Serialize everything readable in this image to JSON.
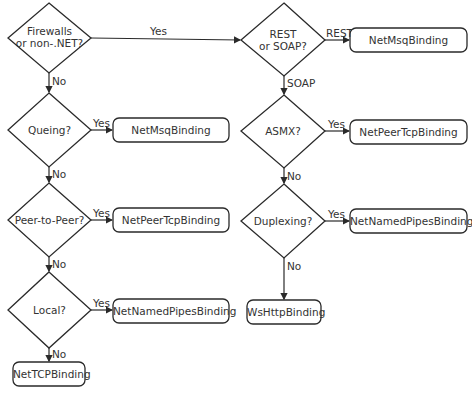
{
  "diagram": {
    "decisions": [
      {
        "id": "firewalls",
        "line1": "Firewalls",
        "line2": "or non-.NET?"
      },
      {
        "id": "queing",
        "line1": "Queing?"
      },
      {
        "id": "peer",
        "line1": "Peer-to-Peer?"
      },
      {
        "id": "local",
        "line1": "Local?"
      },
      {
        "id": "rest-soap",
        "line1": "REST",
        "line2": "or SOAP?"
      },
      {
        "id": "asmx",
        "line1": "ASMX?"
      },
      {
        "id": "duplexing",
        "line1": "Duplexing?"
      }
    ],
    "outcomes": [
      {
        "id": "left-msmq",
        "label": "NetMsqBinding"
      },
      {
        "id": "left-peer",
        "label": "NetPeerTcpBinding"
      },
      {
        "id": "left-pipes",
        "label": "NetNamedPipesBinding"
      },
      {
        "id": "tcp",
        "label": "NetTCPBinding"
      },
      {
        "id": "right-msmq",
        "label": "NetMsqBinding"
      },
      {
        "id": "right-peer",
        "label": "NetPeerTcpBinding"
      },
      {
        "id": "right-pipes",
        "label": "NetNamedPipesBinding"
      },
      {
        "id": "wshttp",
        "label": "WsHttpBinding"
      }
    ],
    "edges": {
      "firewalls_yes": "Yes",
      "firewalls_no": "No",
      "queing_yes": "Yes",
      "queing_no": "No",
      "peer_yes": "Yes",
      "peer_no": "No",
      "local_yes": "Yes",
      "local_no": "No",
      "rest": "REST",
      "soap": "SOAP",
      "asmx_yes": "Yes",
      "asmx_no": "No",
      "duplexing_yes": "Yes",
      "duplexing_no": "No"
    }
  }
}
